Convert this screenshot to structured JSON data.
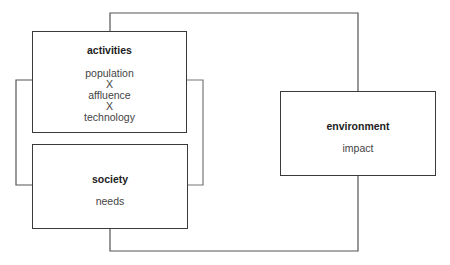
{
  "diagram": {
    "boxes": {
      "activities": {
        "title": "activities",
        "lines": [
          "population",
          "X",
          "affluence",
          "X",
          "technology"
        ]
      },
      "society": {
        "title": "society",
        "lines": [
          "needs"
        ]
      },
      "environment": {
        "title": "environment",
        "lines": [
          "impact"
        ]
      }
    },
    "connections": [
      {
        "from": "activities",
        "to": "environment",
        "route": "top"
      },
      {
        "from": "society",
        "to": "environment",
        "route": "bottom"
      },
      {
        "from": "activities",
        "to": "society",
        "route": "left-bracket"
      },
      {
        "from": "activities",
        "to": "society",
        "route": "right-bracket"
      }
    ],
    "colors": {
      "stroke": "#3a3a3a",
      "background": "#ffffff"
    }
  }
}
